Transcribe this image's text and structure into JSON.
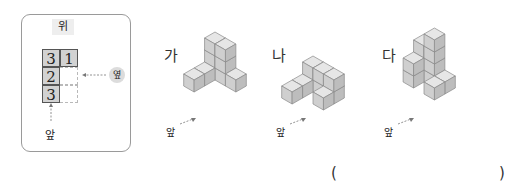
{
  "reference": {
    "top_label": "위",
    "side_label": "옆",
    "front_label": "앞",
    "grid": [
      [
        "3",
        "1"
      ],
      [
        "2",
        ""
      ],
      [
        "3",
        ""
      ]
    ]
  },
  "figures": [
    {
      "label": "가",
      "front_label": "앞"
    },
    {
      "label": "나",
      "front_label": "앞"
    },
    {
      "label": "다",
      "front_label": "앞"
    }
  ],
  "answer": {
    "open": "(",
    "close": ")"
  },
  "colors": {
    "cube_top": "#e6e6e6",
    "cube_left": "#cfcfcf",
    "cube_right": "#bdbdbd",
    "edge": "#8a8a8a"
  }
}
